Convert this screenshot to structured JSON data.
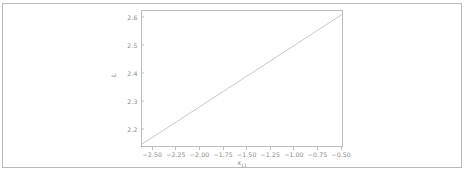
{
  "figure": {
    "background_color": "#ffffff",
    "frame_color": "#b9b9b9",
    "axes_color": "#bdbdbd",
    "tick_label_color": "#8b8b8b",
    "line_color": "#b0b0b0"
  },
  "chart_data": {
    "type": "line",
    "title": "",
    "subtitle": "",
    "xlabel_main": "x",
    "xlabel_sub": "11",
    "ylabel": "L",
    "xlim": [
      -2.62,
      -0.48
    ],
    "ylim": [
      2.135,
      2.625
    ],
    "grid": false,
    "legend": null,
    "xticks": [
      -2.5,
      -2.25,
      -2.0,
      -1.75,
      -1.5,
      -1.25,
      -1.0,
      -0.75,
      -0.5
    ],
    "xtick_labels": [
      "−2.50",
      "−2.25",
      "−2.00",
      "−1.75",
      "−1.50",
      "−1.25",
      "−1.00",
      "−0.75",
      "−0.50"
    ],
    "yticks": [
      2.2,
      2.3,
      2.4,
      2.5,
      2.6
    ],
    "ytick_labels": [
      "2.2",
      "2.3",
      "2.4",
      "2.5",
      "2.6"
    ],
    "series": [
      {
        "name": "L",
        "x": [
          -2.62,
          -2.5,
          -2.25,
          -2.0,
          -1.75,
          -1.5,
          -1.25,
          -1.0,
          -0.75,
          -0.5,
          -0.48
        ],
        "y": [
          2.142,
          2.168,
          2.223,
          2.278,
          2.333,
          2.388,
          2.443,
          2.498,
          2.553,
          2.608,
          2.613
        ]
      }
    ]
  }
}
